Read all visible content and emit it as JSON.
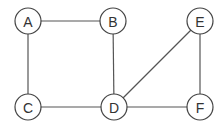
{
  "graph": {
    "nodes": [
      {
        "id": "A",
        "label": "A",
        "x": 28,
        "y": 21
      },
      {
        "id": "B",
        "label": "B",
        "x": 113,
        "y": 21
      },
      {
        "id": "E",
        "label": "E",
        "x": 200,
        "y": 21
      },
      {
        "id": "C",
        "label": "C",
        "x": 28,
        "y": 107
      },
      {
        "id": "D",
        "label": "D",
        "x": 114,
        "y": 107
      },
      {
        "id": "F",
        "label": "F",
        "x": 200,
        "y": 107
      }
    ],
    "edges": [
      {
        "from": "A",
        "to": "B"
      },
      {
        "from": "A",
        "to": "C"
      },
      {
        "from": "B",
        "to": "D"
      },
      {
        "from": "C",
        "to": "D"
      },
      {
        "from": "D",
        "to": "E"
      },
      {
        "from": "D",
        "to": "F"
      },
      {
        "from": "E",
        "to": "F"
      }
    ],
    "node_radius": 13
  }
}
